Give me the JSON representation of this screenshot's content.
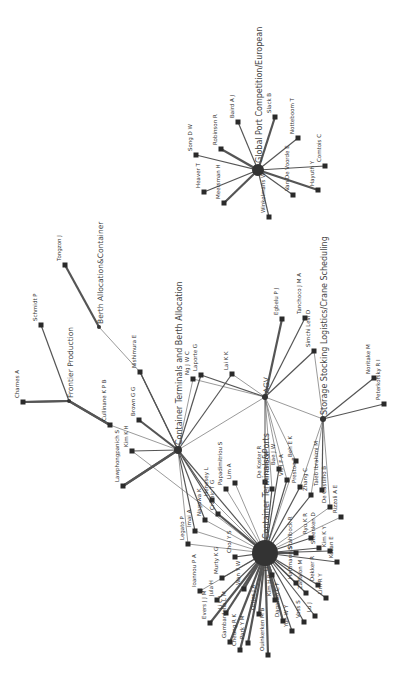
{
  "diagram": {
    "type": "network",
    "orientation": "rotated-90-ccw",
    "colors": {
      "edge": "#555555",
      "node": "#2a2a2a",
      "label": "#333333",
      "background": "#ffffff"
    },
    "hubs": [
      {
        "id": "gpc",
        "label": "Global Port Competition/European",
        "x": 258,
        "y": 170,
        "r": 6
      },
      {
        "id": "fp",
        "label": "Frontier Production",
        "x": 69,
        "y": 401,
        "r": 2
      },
      {
        "id": "bac",
        "label": "Berth Allocation&Container",
        "x": 99,
        "y": 327,
        "r": 2
      },
      {
        "id": "ctba",
        "label": "Container Terminals and Berth Allocation",
        "x": 178,
        "y": 450,
        "r": 4
      },
      {
        "id": "agv",
        "label": "AGV",
        "x": 265,
        "y": 397,
        "r": 3
      },
      {
        "id": "ssl",
        "label": "Storage Stocking Logistics/Crane Scheduling",
        "x": 323,
        "y": 419,
        "r": 3
      },
      {
        "id": "ctp",
        "label": "Container Terminals&Ports",
        "x": 265,
        "y": 553,
        "r": 13
      }
    ],
    "nodes": [
      {
        "id": "song",
        "label": "Song D W",
        "x": 196,
        "y": 155,
        "hub": "gpc",
        "w": 2
      },
      {
        "id": "heaver",
        "label": "Heaver T",
        "x": 204,
        "y": 192,
        "hub": "gpc",
        "w": 2
      },
      {
        "id": "robinson",
        "label": "Robinson R",
        "x": 221,
        "y": 149,
        "hub": "gpc",
        "w": 3
      },
      {
        "id": "meersman",
        "label": "Meersman H",
        "x": 224,
        "y": 203,
        "hub": "gpc",
        "w": 3
      },
      {
        "id": "baird",
        "label": "Baird A J",
        "x": 238,
        "y": 122,
        "hub": "gpc",
        "w": 2
      },
      {
        "id": "slack",
        "label": "Slack B",
        "x": 275,
        "y": 117,
        "hub": "gpc",
        "w": 3
      },
      {
        "id": "winkelmans",
        "label": "Winkelmans W",
        "x": 269,
        "y": 217,
        "hub": "gpc",
        "w": 2
      },
      {
        "id": "notteboom",
        "label": "Notteboom T",
        "x": 298,
        "y": 138,
        "hub": "gpc",
        "w": 2
      },
      {
        "id": "vandevoorde",
        "label": "Van De Voorde E",
        "x": 293,
        "y": 195,
        "hub": "gpc",
        "w": 2
      },
      {
        "id": "hayuth",
        "label": "Hayuth Y",
        "x": 318,
        "y": 190,
        "hub": "gpc",
        "w": 3
      },
      {
        "id": "comtois",
        "label": "Comtois C",
        "x": 325,
        "y": 166,
        "hub": "gpc",
        "w": 2
      },
      {
        "id": "tongzon",
        "label": "Tongzon J",
        "x": 65,
        "y": 265,
        "hub": "bac",
        "w": 3
      },
      {
        "id": "schmidt",
        "label": "Schmidt P",
        "x": 41,
        "y": 325,
        "hub": "fp",
        "w": 2
      },
      {
        "id": "charnes",
        "label": "Charnes A",
        "x": 23,
        "y": 402,
        "hub": "fp",
        "w": 3
      },
      {
        "id": "cullinane",
        "label": "Cullinane K P B",
        "x": 110,
        "y": 425,
        "hub": "fp",
        "w": 3
      },
      {
        "id": "nishimura",
        "label": "Nishimura E",
        "x": 140,
        "y": 372,
        "hub": "ctba",
        "w": 2
      },
      {
        "id": "brown",
        "label": "Brown G G",
        "x": 139,
        "y": 420,
        "hub": "ctba",
        "w": 3
      },
      {
        "id": "kimkh",
        "label": "Kim K H",
        "x": 132,
        "y": 451,
        "hub": "ctba",
        "w": 2
      },
      {
        "id": "lawphong",
        "label": "Lawphongpanich S",
        "x": 123,
        "y": 486,
        "hub": "ctba",
        "w": 3
      },
      {
        "id": "ng",
        "label": "Ng J W C",
        "x": 193,
        "y": 379,
        "hub": "ctba",
        "w": 1
      },
      {
        "id": "laporte",
        "label": "Laporte G",
        "x": 201,
        "y": 375,
        "hub": "ctba",
        "w": 2
      },
      {
        "id": "laikk",
        "label": "Lai K K",
        "x": 232,
        "y": 374,
        "hub": "ctba",
        "w": 2
      },
      {
        "id": "egbelu",
        "label": "Egbelu P J",
        "x": 282,
        "y": 319,
        "hub": "agv",
        "w": 3
      },
      {
        "id": "tanchoco",
        "label": "Tanchoco J M A",
        "x": 305,
        "y": 318,
        "hub": "agv",
        "w": 2
      },
      {
        "id": "simchi",
        "label": "Simchi Levi D",
        "x": 314,
        "y": 351,
        "hub": "agv",
        "w": 2
      },
      {
        "id": "noritake",
        "label": "Noritake M",
        "x": 374,
        "y": 378,
        "hub": "ssl",
        "w": 2
      },
      {
        "id": "peterkofsky",
        "label": "Peterkofsky R I",
        "x": 384,
        "y": 404,
        "hub": "ssl",
        "w": 2
      },
      {
        "id": "dekoster",
        "label": "De Koster R",
        "x": 265,
        "y": 482,
        "hub": "ctp",
        "w": 2
      },
      {
        "id": "gendreau",
        "label": "Gendreau M",
        "x": 272,
        "y": 489,
        "hub": "ctp",
        "w": 2
      },
      {
        "id": "baejw",
        "label": "Bae J W",
        "x": 279,
        "y": 469,
        "hub": "ctp",
        "w": 2
      },
      {
        "id": "vis",
        "label": "Vis I F A",
        "x": 287,
        "y": 480,
        "hub": "ctp",
        "w": 2
      },
      {
        "id": "beh",
        "label": "Beh E K",
        "x": 296,
        "y": 461,
        "hub": "ctp",
        "w": 1
      },
      {
        "id": "preston",
        "label": "Preston P",
        "x": 300,
        "y": 487,
        "hub": "ctp",
        "w": 2
      },
      {
        "id": "zhang",
        "label": "Zhang C",
        "x": 311,
        "y": 495,
        "hub": "ctp",
        "w": 2
      },
      {
        "id": "taleb",
        "label": "Taleb Ibrahimi M",
        "x": 322,
        "y": 490,
        "hub": "ssl",
        "w": 2
      },
      {
        "id": "decastilho",
        "label": "De Castilho B",
        "x": 330,
        "y": 507,
        "hub": "ctp",
        "w": 1
      },
      {
        "id": "ryu",
        "label": "Ryu K R",
        "x": 311,
        "y": 538,
        "hub": "ctp",
        "w": 2
      },
      {
        "id": "steenken",
        "label": "Steenken D",
        "x": 319,
        "y": 548,
        "hub": "ctp",
        "w": 2
      },
      {
        "id": "stahlbock",
        "label": "Stahlbock R",
        "x": 296,
        "y": 553,
        "hub": "ctp",
        "w": 3
      },
      {
        "id": "rizzoli",
        "label": "Rizzoli A E",
        "x": 341,
        "y": 517,
        "hub": "ctp",
        "w": 1
      },
      {
        "id": "kimkv",
        "label": "Kim K Y",
        "x": 330,
        "y": 551,
        "hub": "ctp",
        "w": 2
      },
      {
        "id": "kozan",
        "label": "Kozan E",
        "x": 337,
        "y": 562,
        "hub": "ctp",
        "w": 2
      },
      {
        "id": "dekker",
        "label": "Dekker R",
        "x": 318,
        "y": 585,
        "hub": "ctp",
        "w": 2
      },
      {
        "id": "limr",
        "label": "Lim R Y",
        "x": 326,
        "y": 598,
        "hub": "ctp",
        "w": 2
      },
      {
        "id": "hartmann",
        "label": "Hartmann S",
        "x": 296,
        "y": 583,
        "hub": "ctp",
        "w": 2
      },
      {
        "id": "zaffalon",
        "label": "Zaffalon M",
        "x": 306,
        "y": 593,
        "hub": "ctp",
        "w": 2
      },
      {
        "id": "luj",
        "label": "Lu J",
        "x": 315,
        "y": 616,
        "hub": "ctp",
        "w": 2
      },
      {
        "id": "voss",
        "label": "Voss S",
        "x": 304,
        "y": 622,
        "hub": "ctp",
        "w": 2
      },
      {
        "id": "daganzo",
        "label": "Daganzo C F",
        "x": 283,
        "y": 621,
        "hub": "ctp",
        "w": 3
      },
      {
        "id": "yunwy",
        "label": "Yun W Y",
        "x": 292,
        "y": 631,
        "hub": "ctp",
        "w": 2
      },
      {
        "id": "kimhb",
        "label": "Kim H B",
        "x": 275,
        "y": 600,
        "hub": "ctp",
        "w": 3
      },
      {
        "id": "luc",
        "label": "Liu C I",
        "x": 272,
        "y": 575,
        "hub": "ctp",
        "w": 3
      },
      {
        "id": "dunkerken",
        "label": "Ouinkerken M B",
        "x": 268,
        "y": 655,
        "hub": "ctp",
        "w": 3
      },
      {
        "id": "ottjes",
        "label": "Ottjes J A",
        "x": 259,
        "y": 614,
        "hub": "ctp",
        "w": 3
      },
      {
        "id": "park",
        "label": "Park Y M",
        "x": 248,
        "y": 643,
        "hub": "ctp",
        "w": 3
      },
      {
        "id": "cheung",
        "label": "Cheung R K",
        "x": 240,
        "y": 650,
        "hub": "ctp",
        "w": 3
      },
      {
        "id": "gambardella",
        "label": "Gambardella L M",
        "x": 230,
        "y": 642,
        "hub": "ctp",
        "w": 3
      },
      {
        "id": "liucl",
        "label": "Li C L",
        "x": 226,
        "y": 613,
        "hub": "ctp",
        "w": 3
      },
      {
        "id": "evers",
        "label": "Evers J J M",
        "x": 210,
        "y": 623,
        "hub": "ctp",
        "w": 3
      },
      {
        "id": "jula",
        "label": "Jula H",
        "x": 217,
        "y": 600,
        "hub": "ctp",
        "w": 2
      },
      {
        "id": "wanyw",
        "label": "Wan Y W",
        "x": 244,
        "y": 589,
        "hub": "ctp",
        "w": 3
      },
      {
        "id": "murty",
        "label": "Murty K G",
        "x": 222,
        "y": 578,
        "hub": "ctp",
        "w": 2
      },
      {
        "id": "ioannou",
        "label": "Ioannou P A",
        "x": 200,
        "y": 591,
        "hub": "ctp",
        "w": 1
      },
      {
        "id": "choi",
        "label": "Choi Y S",
        "x": 235,
        "y": 557,
        "hub": "ctp",
        "w": 2
      },
      {
        "id": "legato",
        "label": "Legato P",
        "x": 188,
        "y": 544,
        "hub": "ctp",
        "w": 1
      },
      {
        "id": "imai",
        "label": "Imai A",
        "x": 195,
        "y": 531,
        "hub": "ctba",
        "w": 2
      },
      {
        "id": "nagawa",
        "label": "Nagawa K",
        "x": 205,
        "y": 520,
        "hub": "ctba",
        "w": 2
      },
      {
        "id": "henesey",
        "label": "Henesey L",
        "x": 212,
        "y": 500,
        "hub": "ctba",
        "w": 2
      },
      {
        "id": "crainic",
        "label": "Crainic T G",
        "x": 218,
        "y": 514,
        "hub": "ctba",
        "w": 2
      },
      {
        "id": "papadimitriou",
        "label": "Papadimitriou S",
        "x": 226,
        "y": 489,
        "hub": "ctp",
        "w": 1
      },
      {
        "id": "lima",
        "label": "Lim A",
        "x": 235,
        "y": 483,
        "hub": "ctp",
        "w": 1
      }
    ],
    "extra_edges": [
      [
        "bac",
        "nishimura",
        1
      ],
      [
        "fp",
        "cullinane",
        3
      ],
      [
        "fp",
        "charnes",
        3
      ],
      [
        "cullinane",
        "ctba",
        1
      ],
      [
        "ctba",
        "agv",
        1
      ],
      [
        "laikk",
        "agv",
        1
      ],
      [
        "laporte",
        "agv",
        2
      ],
      [
        "ng",
        "agv",
        1
      ],
      [
        "agv",
        "ssl",
        1
      ],
      [
        "agv",
        "ctp",
        1
      ],
      [
        "agv",
        "dekoster",
        1
      ],
      [
        "agv",
        "gendreau",
        1
      ],
      [
        "agv",
        "baejw",
        1
      ],
      [
        "agv",
        "vis",
        1
      ],
      [
        "agv",
        "beh",
        1
      ],
      [
        "simchi",
        "ssl",
        1
      ],
      [
        "ssl",
        "preston",
        1
      ],
      [
        "ssl",
        "zhang",
        1
      ],
      [
        "ssl",
        "decastilho",
        1
      ],
      [
        "ctba",
        "ctp",
        2
      ],
      [
        "ctba",
        "legato",
        1
      ],
      [
        "ctba",
        "nishimura",
        2
      ],
      [
        "imai",
        "ctp",
        1
      ],
      [
        "nagawa",
        "ctp",
        1
      ],
      [
        "crainic",
        "ctp",
        3
      ],
      [
        "henesey",
        "ctp",
        1
      ],
      [
        "kimkh",
        "ctp",
        1
      ],
      [
        "lawphong",
        "ctba",
        3
      ]
    ]
  }
}
